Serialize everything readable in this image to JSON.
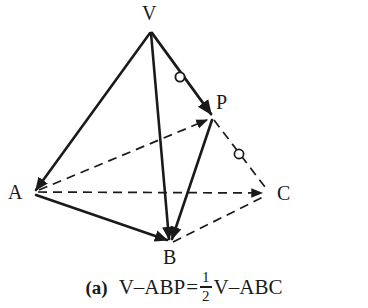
{
  "figure": {
    "type": "geometry-diagram",
    "shape": "tetrahedron",
    "background_color": "#ffffff",
    "stroke_color": "#1a1a1a",
    "vertices": [
      {
        "name": "V",
        "label": "V",
        "x": 150,
        "y": 30,
        "label_x": 142,
        "label_y": 3
      },
      {
        "name": "A",
        "label": "A",
        "x": 33,
        "y": 192,
        "label_x": 8,
        "label_y": 182
      },
      {
        "name": "B",
        "label": "B",
        "x": 170,
        "y": 243,
        "label_x": 163,
        "label_y": 247
      },
      {
        "name": "C",
        "label": "C",
        "x": 268,
        "y": 193,
        "label_x": 277,
        "label_y": 183
      },
      {
        "name": "P",
        "label": "P",
        "x": 212,
        "y": 117,
        "label_x": 216,
        "label_y": 92
      }
    ],
    "edges": [
      {
        "name": "edge-V-A",
        "from": "V",
        "to": "A",
        "style": "solid",
        "width": 2.6,
        "arrow": "end"
      },
      {
        "name": "edge-V-B",
        "from": "V",
        "to": "B",
        "style": "solid",
        "width": 2.6,
        "arrow": "end"
      },
      {
        "name": "edge-V-P",
        "from": "V",
        "to": "P",
        "style": "solid",
        "width": 2.8,
        "arrow": "end"
      },
      {
        "name": "edge-A-B",
        "from": "A",
        "to": "B",
        "style": "solid",
        "width": 2.6,
        "arrow": "end"
      },
      {
        "name": "edge-P-B",
        "from": "P",
        "to": "B",
        "style": "solid",
        "width": 2.6,
        "arrow": "end"
      },
      {
        "name": "edge-A-C",
        "from": "A",
        "to": "C",
        "style": "dashed",
        "width": 1.7,
        "arrow": "end"
      },
      {
        "name": "edge-A-P",
        "from": "A",
        "to": "P",
        "style": "dashed",
        "width": 1.7,
        "arrow": "end"
      },
      {
        "name": "edge-B-C",
        "from": "B",
        "to": "C",
        "style": "dashed",
        "width": 1.7,
        "arrow": "none"
      },
      {
        "name": "edge-P-C",
        "from": "P",
        "to": "C",
        "style": "dashed",
        "width": 1.7,
        "arrow": "none"
      }
    ],
    "tick_marks": [
      {
        "name": "tick-on-VP",
        "on_edge": "edge-V-P",
        "x": 180,
        "y": 77,
        "radius": 5,
        "meaning": "equal-segment-mark"
      },
      {
        "name": "tick-on-PC",
        "on_edge": "edge-P-C",
        "x": 239,
        "y": 154,
        "radius": 5,
        "meaning": "equal-segment-mark"
      }
    ]
  },
  "caption": {
    "index": "(a)",
    "left_term": "V–ABP",
    "equals": "=",
    "fraction_numerator": "1",
    "fraction_denominator": "2",
    "right_term": "V–ABC",
    "full_text": "(a)  V–ABP = 1/2 V–ABC"
  }
}
